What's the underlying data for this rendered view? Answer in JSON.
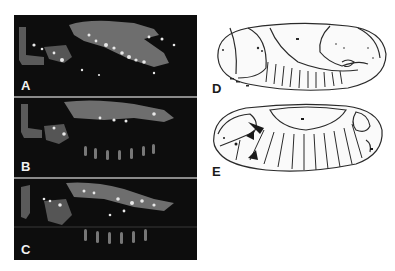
{
  "figure": {
    "panels": [
      {
        "id": "A",
        "label": "A",
        "type": "fluorescence-micrograph"
      },
      {
        "id": "B",
        "label": "B",
        "type": "fluorescence-micrograph"
      },
      {
        "id": "C",
        "label": "C",
        "type": "fluorescence-micrograph"
      }
    ],
    "drawings": [
      {
        "id": "D",
        "label": "D",
        "type": "embryo-line-drawing"
      },
      {
        "id": "E",
        "label": "E",
        "type": "embryo-line-drawing"
      }
    ],
    "colors": {
      "panel_background": "#0d0d0d",
      "tissue_gray": "#6e6e6e",
      "bright_spots": "#e8e8e8",
      "divider": "#8a8a8a",
      "drawing_line": "#2a2a2a"
    }
  }
}
